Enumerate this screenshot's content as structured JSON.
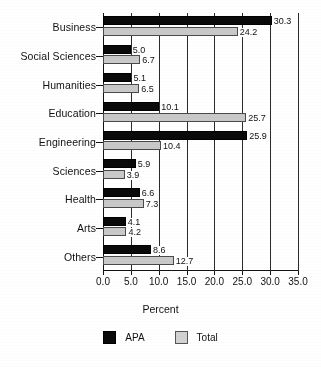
{
  "chart_data": {
    "type": "bar",
    "orientation": "horizontal",
    "title": "",
    "xlabel": "Percent",
    "ylabel": "",
    "xlim": [
      0.0,
      35.0
    ],
    "xticks": [
      "0.0",
      "5.0",
      "10.0",
      "15.0",
      "20.0",
      "25.0",
      "30.0",
      "35.0"
    ],
    "xtick_values": [
      0,
      5,
      10,
      15,
      20,
      25,
      30,
      35
    ],
    "grid": "vertical",
    "legend_position": "bottom",
    "categories": [
      "Business",
      "Social Sciences",
      "Humanities",
      "Education",
      "Engineering",
      "Sciences",
      "Health",
      "Arts",
      "Others"
    ],
    "series": [
      {
        "name": "APA",
        "color": "#0a0a0a",
        "values": [
          30.3,
          5.0,
          5.1,
          10.1,
          25.9,
          5.9,
          6.6,
          4.1,
          8.6
        ],
        "labels": [
          "30.3",
          "5.0",
          "5.1",
          "10.1",
          "25.9",
          "5.9",
          "6.6",
          "4.1",
          "8.6"
        ]
      },
      {
        "name": "Total",
        "color": "#c9c9c9",
        "values": [
          24.2,
          6.7,
          6.5,
          25.7,
          10.4,
          3.9,
          7.3,
          4.2,
          12.7
        ],
        "labels": [
          "24.2",
          "6.7",
          "6.5",
          "25.7",
          "10.4",
          "3.9",
          "7.3",
          "4.2",
          "12.7"
        ]
      }
    ]
  },
  "legend": {
    "items": [
      {
        "label": "APA",
        "swatch": "black-square-swatch"
      },
      {
        "label": "Total",
        "swatch": "gray-square-swatch"
      }
    ]
  }
}
